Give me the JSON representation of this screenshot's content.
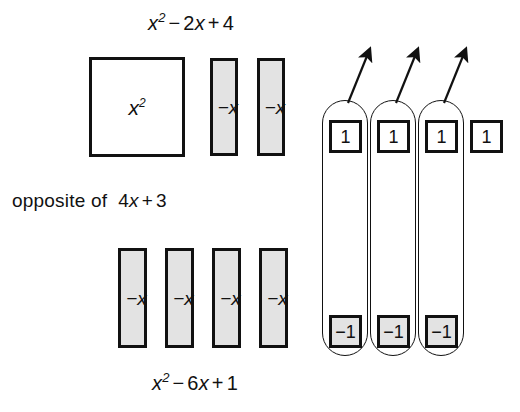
{
  "figure": {
    "type": "algebra-tile-diagram",
    "background_color": "#ffffff",
    "ink_color": "#111111",
    "tile_shade_color": "#e3e3e3"
  },
  "labels": {
    "title_expression": "x2 − 2x + 4",
    "title_parts": {
      "base": "x",
      "exponent": "2",
      "rest_minus": "−",
      "coef": "2",
      "var": "x",
      "plus": "+",
      "constant": "4"
    },
    "middle_line_lead": "opposite of",
    "middle_expression": "4x + 3",
    "middle_parts": {
      "coef": "4",
      "var": "x",
      "plus": "+",
      "constant": "3"
    },
    "bottom_expression": "x2 − 6x + 1",
    "bottom_parts": {
      "base": "x",
      "exponent": "2",
      "minus": "−",
      "coef": "6",
      "var": "x",
      "plus": "+",
      "constant": "1"
    }
  },
  "tiles": {
    "x_squared": {
      "label_base": "x",
      "label_exponent": "2",
      "shaded": false,
      "count": 1
    },
    "top_neg_x": {
      "label": "−x",
      "shaded": true,
      "count": 2
    },
    "bottom_neg_x": {
      "label": "−x",
      "shaded": true,
      "count": 4
    },
    "unit_positive": {
      "label": "1",
      "shaded": false,
      "count": 4
    },
    "unit_negative": {
      "label": "−1",
      "shaded": true,
      "count": 3
    }
  },
  "zero_pairs": {
    "loop_count": 3,
    "arrow_count": 3,
    "note": "each loop encircles one +1 tile and one −1 tile forming a zero pair; arrows point out of each loop"
  },
  "layout": {
    "top_row_label": "x2 − 2x + 4",
    "bottom_row_label": "x2 − 6x + 1"
  }
}
